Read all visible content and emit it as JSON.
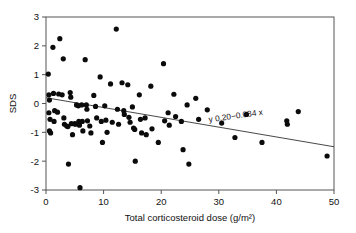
{
  "chart_data": {
    "type": "scatter",
    "title": "",
    "xlabel": "Total corticosteroid dose (g/m²)",
    "ylabel": "SDS",
    "xlim": [
      0,
      50
    ],
    "ylim": [
      -3,
      3
    ],
    "xticks": [
      0,
      10,
      20,
      30,
      40,
      50
    ],
    "yticks": [
      3,
      2,
      1,
      0,
      -1,
      -2,
      -3
    ],
    "xtick_labels": [
      "0",
      "10",
      "20",
      "30",
      "40",
      "50"
    ],
    "ytick_labels": [
      "3",
      "2",
      "1",
      "0",
      "-1",
      "-2",
      "-3"
    ],
    "grid": false,
    "legend": false,
    "annotation": "y 0.20−0.034 x",
    "annotation_x": 33.0,
    "annotation_y": -0.52,
    "regression": {
      "intercept": 0.2,
      "slope": -0.034,
      "x_start": 0.0,
      "x_end": 50.0,
      "label": "y 0.20−0.034 x"
    },
    "marker": {
      "shape": "circle",
      "color": "#0b0b0b",
      "size": 2.6
    },
    "points": [
      [
        0.4,
        1.02
      ],
      [
        0.5,
        0.3
      ],
      [
        0.6,
        0.12
      ],
      [
        0.5,
        -0.32
      ],
      [
        0.7,
        -0.55
      ],
      [
        0.6,
        -0.95
      ],
      [
        0.8,
        -1.02
      ],
      [
        1.2,
        1.95
      ],
      [
        1.3,
        0.35
      ],
      [
        1.5,
        -0.25
      ],
      [
        1.4,
        -0.62
      ],
      [
        2.0,
        -0.3
      ],
      [
        2.2,
        0.33
      ],
      [
        2.4,
        2.25
      ],
      [
        2.8,
        0.3
      ],
      [
        3.0,
        1.55
      ],
      [
        3.1,
        -0.5
      ],
      [
        3.2,
        -0.72
      ],
      [
        3.6,
        -0.78
      ],
      [
        3.8,
        -0.8
      ],
      [
        3.9,
        -2.1
      ],
      [
        4.2,
        0.38
      ],
      [
        4.3,
        0.22
      ],
      [
        4.4,
        -0.7
      ],
      [
        4.6,
        -1.08
      ],
      [
        5.0,
        -0.7
      ],
      [
        5.1,
        -0.72
      ],
      [
        5.3,
        -0.05
      ],
      [
        5.6,
        -0.08
      ],
      [
        5.7,
        -0.62
      ],
      [
        5.8,
        -0.75
      ],
      [
        5.9,
        -2.92
      ],
      [
        6.2,
        -0.05
      ],
      [
        6.3,
        -0.62
      ],
      [
        6.4,
        -0.95
      ],
      [
        6.8,
        1.52
      ],
      [
        7.0,
        -0.05
      ],
      [
        7.1,
        -0.2
      ],
      [
        7.2,
        -0.6
      ],
      [
        7.6,
        -0.78
      ],
      [
        7.8,
        -1.02
      ],
      [
        8.3,
        0.28
      ],
      [
        8.6,
        -0.1
      ],
      [
        8.8,
        -0.5
      ],
      [
        9.4,
        0.92
      ],
      [
        9.6,
        -0.62
      ],
      [
        9.8,
        -1.35
      ],
      [
        10.2,
        -0.08
      ],
      [
        10.4,
        -0.58
      ],
      [
        10.6,
        -1.0
      ],
      [
        11.2,
        0.68
      ],
      [
        11.5,
        -0.65
      ],
      [
        12.2,
        2.58
      ],
      [
        12.4,
        -0.2
      ],
      [
        12.6,
        -0.72
      ],
      [
        13.2,
        0.72
      ],
      [
        13.5,
        -0.25
      ],
      [
        13.6,
        -0.38
      ],
      [
        14.2,
        0.65
      ],
      [
        14.4,
        -0.48
      ],
      [
        14.6,
        -0.65
      ],
      [
        15.0,
        -0.12
      ],
      [
        15.2,
        -0.85
      ],
      [
        15.4,
        -0.9
      ],
      [
        15.5,
        -2.0
      ],
      [
        16.2,
        0.3
      ],
      [
        16.4,
        -0.55
      ],
      [
        16.6,
        -1.02
      ],
      [
        17.2,
        -0.5
      ],
      [
        17.4,
        -1.08
      ],
      [
        18.2,
        0.6
      ],
      [
        18.4,
        -0.88
      ],
      [
        19.5,
        -1.35
      ],
      [
        20.4,
        1.38
      ],
      [
        20.6,
        -0.6
      ],
      [
        21.2,
        -0.32
      ],
      [
        21.4,
        -0.75
      ],
      [
        22.2,
        0.32
      ],
      [
        22.5,
        -0.45
      ],
      [
        23.5,
        -0.62
      ],
      [
        23.8,
        -1.6
      ],
      [
        24.5,
        -0.05
      ],
      [
        24.8,
        -2.1
      ],
      [
        26.0,
        0.18
      ],
      [
        26.5,
        -0.55
      ],
      [
        28.0,
        -0.22
      ],
      [
        30.5,
        -0.68
      ],
      [
        32.8,
        -1.18
      ],
      [
        34.8,
        -0.38
      ],
      [
        37.5,
        -1.35
      ],
      [
        41.8,
        -0.6
      ],
      [
        41.9,
        -0.72
      ],
      [
        43.8,
        -0.28
      ],
      [
        48.8,
        -1.82
      ]
    ]
  },
  "figure": {
    "axis_label_y": "SDS",
    "axis_label_x": "Total corticosteroid dose (g/m²)",
    "equation_text": "y 0.20−0.034 x",
    "frame_color": "#555555",
    "point_color": "#0b0b0b",
    "line_color": "#333333",
    "background": "#ffffff"
  }
}
